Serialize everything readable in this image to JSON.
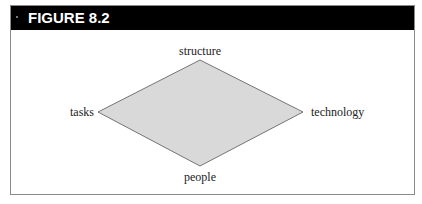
{
  "figure": {
    "title": "FIGURE 8.2"
  },
  "diagram": {
    "shape": "diamond",
    "fill_color": "#d9d9d9",
    "stroke_color": "#555555",
    "vertices": {
      "top": "structure",
      "left": "tasks",
      "right": "technology",
      "bottom": "people"
    }
  },
  "colors": {
    "header_bg": "#000000",
    "header_text": "#ffffff",
    "border": "#8a8a8a"
  }
}
